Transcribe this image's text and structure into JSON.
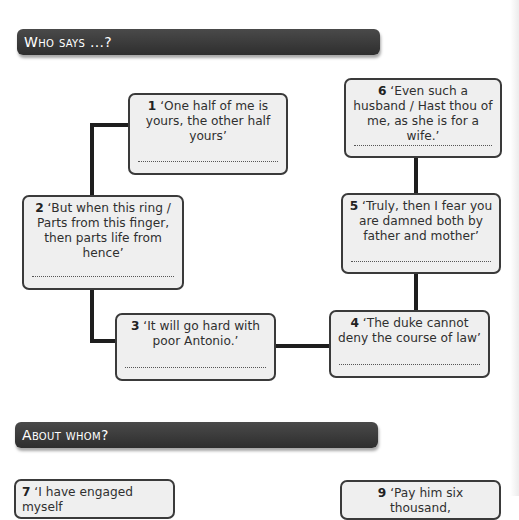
{
  "sections": [
    {
      "title": "Who says ...?"
    },
    {
      "title": "About whom?"
    }
  ],
  "who_says": {
    "quotes": [
      {
        "number": "1",
        "text": "‘One half of me is yours, the other half yours’",
        "answer": ""
      },
      {
        "number": "2",
        "text": "‘But when this ring / Parts from this finger, then parts life from hence’",
        "answer": ""
      },
      {
        "number": "3",
        "text": "‘It will go hard with poor Antonio.’",
        "answer": ""
      },
      {
        "number": "4",
        "text": "‘The duke cannot deny the course of law’",
        "answer": ""
      },
      {
        "number": "5",
        "text": "‘Truly, then I fear you are damned both by father and mother’",
        "answer": ""
      },
      {
        "number": "6",
        "text": "‘Even such a husband / Hast thou of me, as she is for a wife.’",
        "answer": ""
      }
    ]
  },
  "about_whom": {
    "quotes": [
      {
        "number": "7",
        "text": "‘I have engaged myself"
      },
      {
        "number": "9",
        "text": "‘Pay him six thousand,"
      }
    ]
  }
}
